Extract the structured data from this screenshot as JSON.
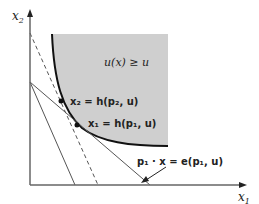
{
  "diagram": {
    "axis_x_label": "x",
    "axis_x_sub": "1",
    "axis_y_label": "x",
    "axis_y_sub": "2",
    "region_label": "u(x) ≥ u",
    "point2_label": "x₂ = h(p₂, u)",
    "point1_label": "x₁ = h(p₁, u)",
    "budget_label": "p₁ · x = e(p₁, u)",
    "colors": {
      "region_fill": "#cfcfcf",
      "curve": "#111111",
      "lines": "#444444",
      "axes": "#555555"
    }
  }
}
